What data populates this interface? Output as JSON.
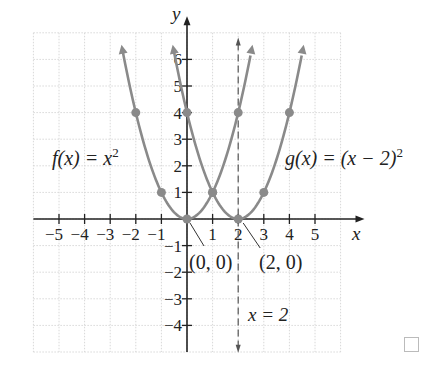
{
  "chart_data": {
    "type": "line",
    "title": "",
    "xlabel": "x",
    "ylabel": "y",
    "xlim": [
      -6,
      6
    ],
    "ylim": [
      -5,
      7
    ],
    "grid": true,
    "x_ticks": [
      "-5",
      "-4",
      "-3",
      "-2",
      "-1",
      "1",
      "2",
      "3",
      "4",
      "5"
    ],
    "y_ticks": [
      "6",
      "5",
      "4",
      "3",
      "2",
      "1",
      "-1",
      "-2",
      "-3",
      "-4"
    ],
    "series": [
      {
        "name": "f(x) = x^2",
        "label": "f(x) = x²",
        "points": [
          [
            -2,
            4
          ],
          [
            -1,
            1
          ],
          [
            0,
            0
          ],
          [
            1,
            1
          ],
          [
            2,
            4
          ]
        ],
        "vertex": [
          0,
          0
        ]
      },
      {
        "name": "g(x) = (x - 2)^2",
        "label": "g(x) = (x − 2)²",
        "points": [
          [
            0,
            4
          ],
          [
            1,
            1
          ],
          [
            2,
            0
          ],
          [
            3,
            1
          ],
          [
            4,
            4
          ]
        ],
        "vertex": [
          2,
          0
        ]
      }
    ],
    "annotations": [
      {
        "text": "(0, 0)",
        "points_to": [
          0,
          0
        ]
      },
      {
        "text": "(2, 0)",
        "points_to": [
          2,
          0
        ]
      },
      {
        "text": "x = 2",
        "type": "dashed vertical line",
        "x": 2
      }
    ],
    "colors": {
      "curve": "#8a8a8a",
      "axis": "#222222",
      "grid": "#d8d8d8",
      "dashed": "#555555"
    }
  },
  "labels": {
    "f_label": "f(x) = x",
    "f_exp": "2",
    "g_label": "g(x) = (x − 2)",
    "g_exp": "2",
    "vertex_f": "(0, 0)",
    "vertex_g": "(2, 0)",
    "axis_line": "x = 2",
    "x_axis": "x",
    "y_axis": "y"
  }
}
